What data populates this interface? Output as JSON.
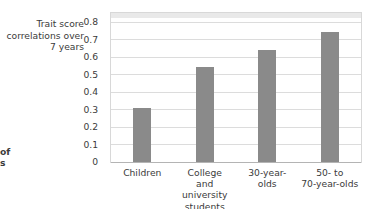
{
  "axis_title": "Trait score correlations over 7 years",
  "margin_fragments": {
    "line1": "of",
    "line2": "s"
  },
  "colors": {
    "bar": "#8a8a8a",
    "gridline": "#dcdcdc",
    "plot_border": "#d8d8d8",
    "text": "#3b3b3b",
    "background": "#ffffff"
  },
  "chart_data": {
    "type": "bar",
    "title": "",
    "xlabel": "",
    "ylabel": "Trait score correlations over 7 years",
    "ylim": [
      0,
      0.85
    ],
    "ytick_values": [
      0,
      0.1,
      0.2,
      0.3,
      0.4,
      0.5,
      0.6,
      0.7,
      0.8
    ],
    "ytick_labels": [
      "0",
      "0.1",
      "0.2",
      "0.3",
      "0.4",
      "0.5",
      "0.6",
      "0.7",
      "0.8"
    ],
    "grid": true,
    "legend": "none",
    "categories": [
      "Children",
      "College\nand\nuniversity\nstudents",
      "30-year-\nolds",
      "50-  to\n70-year-olds"
    ],
    "values": [
      0.31,
      0.54,
      0.64,
      0.74
    ]
  }
}
